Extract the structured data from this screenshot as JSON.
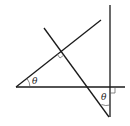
{
  "diagram": {
    "type": "geometry",
    "colors": {
      "line": "#1a1a1a",
      "mark": "#555555",
      "background": "#ffffff"
    },
    "lines": [
      {
        "id": "horizontal-line",
        "x1": 16,
        "y1": 87,
        "x2": 125,
        "y2": 87
      },
      {
        "id": "vertical-line",
        "x1": 110,
        "y1": 5,
        "x2": 110,
        "y2": 117
      },
      {
        "id": "inclined-line",
        "x1": 16,
        "y1": 87,
        "x2": 101,
        "y2": 20
      },
      {
        "id": "transversal-line",
        "x1": 44,
        "y1": 28,
        "x2": 109,
        "y2": 117
      }
    ],
    "labels": [
      {
        "id": "theta-left",
        "text": "θ",
        "x": 32,
        "y": 75
      },
      {
        "id": "theta-bottom",
        "text": "θ",
        "x": 100,
        "y": 93
      }
    ],
    "right_angle_marks": [
      {
        "id": "right-angle-intersection",
        "at": [
          61,
          51
        ]
      },
      {
        "id": "right-angle-vertical",
        "at": [
          110,
          87
        ]
      }
    ]
  }
}
